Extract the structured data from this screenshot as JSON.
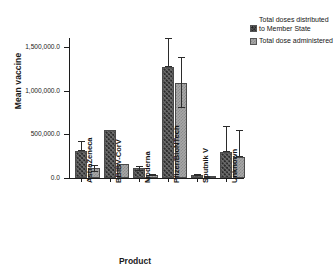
{
  "chart_data": {
    "type": "bar",
    "title": "",
    "xlabel": "Product",
    "ylabel": "Mean vaccine",
    "ylim": [
      0,
      1600000
    ],
    "grid": false,
    "legend_position": "right",
    "ytick_labels": [
      "1,500,000.0",
      "1,000,000.0",
      "500,000.0",
      "0.0"
    ],
    "ytick_values": [
      1500000,
      1000000,
      500000,
      0
    ],
    "categories": [
      "AstraZeneca",
      "BBIBV-CorV",
      "Moderna",
      "Pfizer/BioNTech",
      "Sputnik V",
      "Unknown"
    ],
    "series": [
      {
        "name": "Total doses distributed to Member State",
        "values": [
          312000,
          545000,
          110000,
          1267000,
          35000,
          300000
        ],
        "error_low": [
          312000,
          545000,
          75000,
          1267000,
          25000,
          300000
        ],
        "error_high": [
          422000,
          545000,
          140000,
          1600000,
          45000,
          600000
        ]
      },
      {
        "name": "Total dose administered",
        "values": [
          110000,
          155000,
          30000,
          1089000,
          3000,
          245000
        ],
        "error_low": [
          70000,
          155000,
          18000,
          800000,
          3000,
          245000
        ],
        "error_high": [
          150000,
          155000,
          42000,
          1378000,
          3000,
          545000
        ]
      }
    ]
  },
  "legend": {
    "entries": [
      {
        "label": "Total doses distributed to Member State",
        "swatch": "distributed-swatch"
      },
      {
        "label": "Total dose administered",
        "swatch": "administered-swatch"
      }
    ]
  },
  "axes": {
    "y_title": "Mean vaccine",
    "x_title": "Product"
  }
}
